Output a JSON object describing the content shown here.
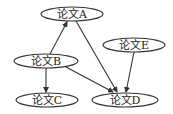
{
  "diagram": {
    "type": "directed-graph",
    "nodes": [
      {
        "id": "A",
        "label": "论文A",
        "cx": 72,
        "cy": 14,
        "rx": 31,
        "ry": 7
      },
      {
        "id": "B",
        "label": "论文B",
        "cx": 46,
        "cy": 61,
        "rx": 32,
        "ry": 7
      },
      {
        "id": "C",
        "label": "论文C",
        "cx": 47,
        "cy": 100,
        "rx": 31,
        "ry": 7
      },
      {
        "id": "D",
        "label": "论文D",
        "cx": 125,
        "cy": 100,
        "rx": 33,
        "ry": 7
      },
      {
        "id": "E",
        "label": "论文E",
        "cx": 134,
        "cy": 45,
        "rx": 31,
        "ry": 7
      }
    ],
    "edges": [
      {
        "from": "B",
        "to": "A"
      },
      {
        "from": "A",
        "to": "D"
      },
      {
        "from": "B",
        "to": "C"
      },
      {
        "from": "B",
        "to": "D"
      },
      {
        "from": "E",
        "to": "D"
      }
    ]
  }
}
